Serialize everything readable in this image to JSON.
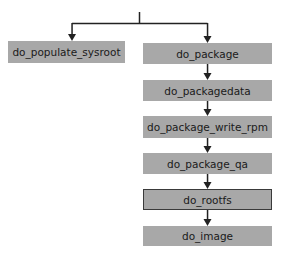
{
  "diagram": {
    "type": "task-flow",
    "nodes": [
      {
        "id": "do_populate_sysroot",
        "label": "do_populate_sysroot",
        "x": 8,
        "y": 41,
        "w": 117,
        "h": 22,
        "highlighted": false
      },
      {
        "id": "do_package",
        "label": "do_package",
        "x": 143,
        "y": 43,
        "w": 129,
        "h": 21,
        "highlighted": false
      },
      {
        "id": "do_packagedata",
        "label": "do_packagedata",
        "x": 143,
        "y": 80,
        "w": 129,
        "h": 21,
        "highlighted": false
      },
      {
        "id": "do_package_write_rpm",
        "label": "do_package_write_rpm",
        "x": 143,
        "y": 116,
        "w": 129,
        "h": 22,
        "highlighted": false
      },
      {
        "id": "do_package_qa",
        "label": "do_package_qa",
        "x": 143,
        "y": 153,
        "w": 129,
        "h": 21,
        "highlighted": false
      },
      {
        "id": "do_rootfs",
        "label": "do_rootfs",
        "x": 143,
        "y": 189,
        "w": 129,
        "h": 21,
        "highlighted": true
      },
      {
        "id": "do_image",
        "label": "do_image",
        "x": 143,
        "y": 226,
        "w": 129,
        "h": 20,
        "highlighted": false
      }
    ],
    "edges": [
      {
        "from": "root",
        "to": "do_populate_sysroot"
      },
      {
        "from": "root",
        "to": "do_package"
      },
      {
        "from": "do_package",
        "to": "do_packagedata"
      },
      {
        "from": "do_packagedata",
        "to": "do_package_write_rpm"
      },
      {
        "from": "do_package_write_rpm",
        "to": "do_package_qa"
      },
      {
        "from": "do_package_qa",
        "to": "do_rootfs"
      },
      {
        "from": "do_rootfs",
        "to": "do_image"
      }
    ],
    "colors": {
      "box_fill": "#a8a8a8",
      "line": "#222222",
      "highlight_border": "#3a3a3a"
    }
  }
}
